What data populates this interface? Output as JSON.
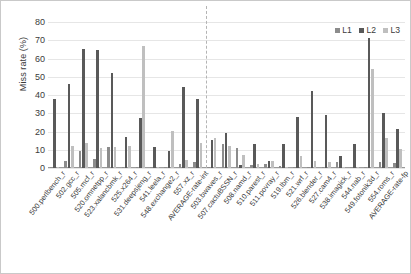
{
  "chart_data": {
    "type": "bar",
    "title": "",
    "xlabel": "",
    "ylabel": "Miss rate (%)",
    "ylim": [
      0,
      80
    ],
    "ytick_labels": [
      "0",
      "10",
      "20",
      "30",
      "40",
      "50",
      "60",
      "70",
      "80"
    ],
    "ytick_values": [
      0,
      10,
      20,
      30,
      40,
      50,
      60,
      70,
      80
    ],
    "grid": true,
    "legend_position": "top-right",
    "legend": [
      "L1",
      "L2",
      "L3"
    ],
    "series_colors": {
      "L1": "#8c8c8c",
      "L2": "#595959",
      "L3": "#bfbfbf"
    },
    "divider_after_category": "AVERAGE-rate-int",
    "categories": [
      "500.perlbench_r",
      "502.gcc_r",
      "505.mcf_r",
      "520.omnetpp_r",
      "523.xalancbmk_r",
      "525.x264_r",
      "531.deepsjeng_r",
      "541.leela_r",
      "548.exchange2_r",
      "557.xz_r",
      "AVERAGE-rate-int",
      "503.bwaves_r",
      "507.cactuBSSN_r",
      "508.namd_r",
      "510.parest_r",
      "511.povray_r",
      "519.lbm_r",
      "521.wrf_r",
      "526.blender_r",
      "527.cam4_r",
      "538.imagick_r",
      "544.nab_r",
      "549.fotonik3d_r",
      "554.roms_r",
      "AVERAGE-rate-fp"
    ],
    "series": [
      {
        "name": "L1",
        "values": [
          0.6,
          3.8,
          9.5,
          4.9,
          11.6,
          0.5,
          0.6,
          0.5,
          0.4,
          2.4,
          3.4,
          0.5,
          13.0,
          10.9,
          1.4,
          2.4,
          1.3,
          0.4,
          0.5,
          0.6,
          3.3,
          0.3,
          0.5,
          3.5,
          2.8
        ]
      },
      {
        "name": "L2",
        "values": [
          37.8,
          46.2,
          65.4,
          64.5,
          51.9,
          16.8,
          27.2,
          11.7,
          9.4,
          44.5,
          37.7,
          15.6,
          19.4,
          1.9,
          13.2,
          3.8,
          13.2,
          27.9,
          42.0,
          29.0,
          6.7,
          13.3,
          71.4,
          30.2,
          21.3
        ]
      },
      {
        "name": "L3",
        "values": [
          0.5,
          11.9,
          13.5,
          11.0,
          11.7,
          11.9,
          67.0,
          0.5,
          20.3,
          4.6,
          13.9,
          16.7,
          12.3,
          7.2,
          2.3,
          3.7,
          0.4,
          6.6,
          3.6,
          3.3,
          0.4,
          0.5,
          54.0,
          16.4,
          10.6
        ]
      }
    ]
  }
}
